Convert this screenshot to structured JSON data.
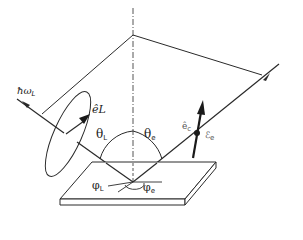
{
  "figure": {
    "type": "scattering geometry diagram",
    "colors": {
      "line": "#2a2a2a",
      "background": "#ffffff"
    }
  },
  "labels": {
    "photon": {
      "main": "ħω",
      "sub": "L"
    },
    "laser_polarization": {
      "main": "ê",
      "sub": "L"
    },
    "theta_L": {
      "main": "θ",
      "sub": "L"
    },
    "theta_e": {
      "main": "θ",
      "sub": "e"
    },
    "electron_polarization": {
      "main": "ê",
      "sub": "c"
    },
    "electron_energy": {
      "main": "ℰ",
      "sub": "e"
    },
    "phi_L": {
      "main": "φ",
      "sub": "L"
    },
    "phi_e": {
      "main": "φ",
      "sub": "e"
    }
  }
}
